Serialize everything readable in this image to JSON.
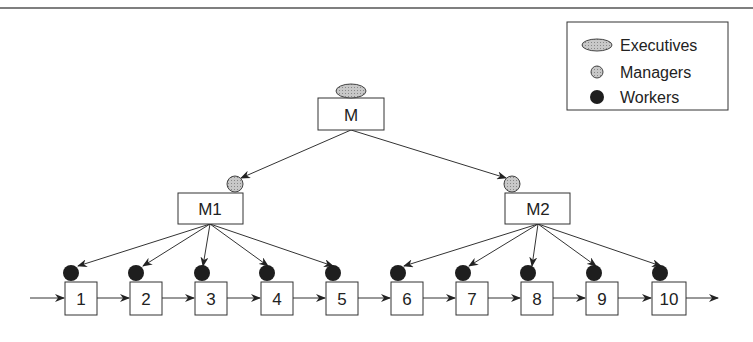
{
  "diagram": {
    "type": "hierarchy",
    "colors": {
      "line": "#333333",
      "executive_fill": "#b8b8b8",
      "manager_fill": "#c4c4c4",
      "worker_fill": "#1e1e1e",
      "box_fill": "#ffffff"
    },
    "legend": {
      "items": [
        {
          "label": "Executives",
          "marker": "ellipse-hatched"
        },
        {
          "label": "Managers",
          "marker": "circle-gray"
        },
        {
          "label": "Workers",
          "marker": "circle-black"
        }
      ]
    },
    "top_node": {
      "label": "M",
      "role": "Executives"
    },
    "managers": [
      {
        "label": "M1",
        "role": "Managers",
        "children": [
          "1",
          "2",
          "3",
          "4",
          "5"
        ]
      },
      {
        "label": "M2",
        "role": "Managers",
        "children": [
          "6",
          "7",
          "8",
          "9",
          "10"
        ]
      }
    ],
    "workers": [
      {
        "label": "1"
      },
      {
        "label": "2"
      },
      {
        "label": "3"
      },
      {
        "label": "4"
      },
      {
        "label": "5"
      },
      {
        "label": "6"
      },
      {
        "label": "7"
      },
      {
        "label": "8"
      },
      {
        "label": "9"
      },
      {
        "label": "10"
      }
    ]
  }
}
